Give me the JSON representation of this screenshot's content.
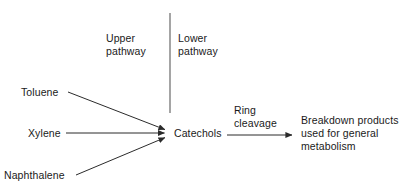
{
  "diagram": {
    "background_color": "#ffffff",
    "stroke_color": "#2b2b2b",
    "text_color": "#1a1a1a",
    "divider": {
      "name": "pathway-divider",
      "x": 170,
      "y1": 13,
      "y2": 113
    },
    "sections": {
      "upper_pathway": "Upper\npathway",
      "lower_pathway": "Lower\npathway"
    },
    "substrates": [
      {
        "label": "Toluene",
        "x": 21,
        "y": 86
      },
      {
        "label": "Xylene",
        "x": 28,
        "y": 127
      },
      {
        "label": "Naphthalene",
        "x": 4,
        "y": 169
      }
    ],
    "intermediate": {
      "label": "Catechols",
      "x": 174,
      "y": 127
    },
    "process": {
      "label": "Ring\ncleavage"
    },
    "product": {
      "label": "Breakdown products\nused for general\nmetabolism"
    },
    "arrows": [
      {
        "name": "toluene-to-catechols",
        "x1": 68,
        "y1": 92,
        "x2": 169,
        "y2": 131
      },
      {
        "name": "xylene-to-catechols",
        "x1": 66,
        "y1": 133,
        "x2": 169,
        "y2": 133
      },
      {
        "name": "naphthalene-to-catechols",
        "x1": 76,
        "y1": 175,
        "x2": 169,
        "y2": 136
      },
      {
        "name": "catechols-to-breakdown",
        "x1": 227,
        "y1": 135,
        "x2": 296,
        "y2": 135
      }
    ]
  }
}
